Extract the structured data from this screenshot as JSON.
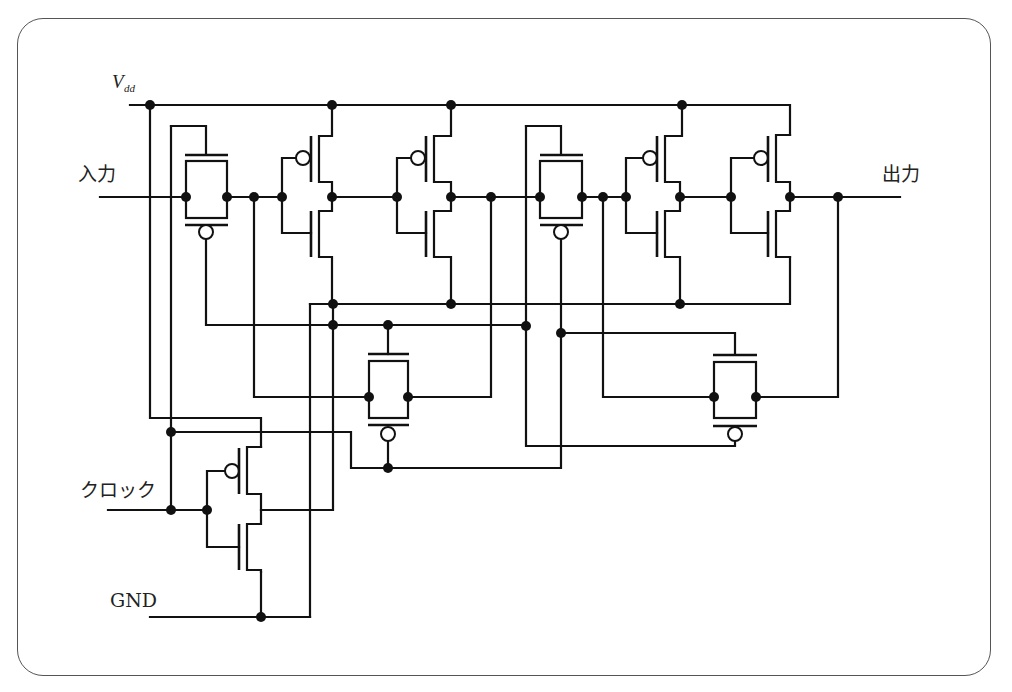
{
  "diagram": {
    "type": "circuit-schematic",
    "labels": {
      "vdd_main": "V",
      "vdd_sub": "dd",
      "input": "入力",
      "output": "出力",
      "clock": "クロック",
      "gnd": "GND"
    },
    "components": [
      {
        "id": "tg1",
        "kind": "transmission-gate"
      },
      {
        "id": "inv1",
        "kind": "cmos-inverter"
      },
      {
        "id": "inv2",
        "kind": "cmos-inverter"
      },
      {
        "id": "tg2",
        "kind": "transmission-gate"
      },
      {
        "id": "inv3",
        "kind": "cmos-inverter"
      },
      {
        "id": "inv4",
        "kind": "cmos-inverter"
      },
      {
        "id": "tg3",
        "kind": "transmission-gate"
      },
      {
        "id": "tg4",
        "kind": "transmission-gate"
      },
      {
        "id": "clk-inv",
        "kind": "cmos-inverter"
      }
    ],
    "colors": {
      "wire": "#111111",
      "frame": "#555555",
      "background": "#ffffff"
    }
  }
}
